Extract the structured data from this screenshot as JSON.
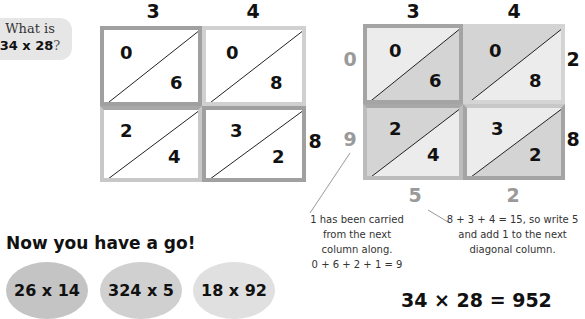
{
  "question": {
    "line1": "What is",
    "expression": "34 x 28",
    "mark": "?"
  },
  "left_grid": {
    "top_digits": [
      "3",
      "4"
    ],
    "right_digits": [
      "2",
      "8"
    ],
    "cells": [
      {
        "tens": "0",
        "units": "6"
      },
      {
        "tens": "0",
        "units": "8"
      },
      {
        "tens": "2",
        "units": "4"
      },
      {
        "tens": "3",
        "units": "2"
      }
    ]
  },
  "right_grid": {
    "top_digits": [
      "3",
      "4"
    ],
    "right_digits": [
      "2",
      "8"
    ],
    "left_results": [
      "0",
      "9"
    ],
    "bottom_results": [
      "5",
      "2"
    ],
    "cells": [
      {
        "tens": "0",
        "units": "6"
      },
      {
        "tens": "0",
        "units": "8"
      },
      {
        "tens": "2",
        "units": "4"
      },
      {
        "tens": "3",
        "units": "2"
      }
    ]
  },
  "notes": {
    "carry": [
      "1 has been carried",
      "from the next",
      "column along.",
      "0 + 6 + 2 + 1 = 9"
    ],
    "sum": [
      "8 + 3 + 4 = 15, so  write 5",
      "and add 1 to the next",
      "diagonal column."
    ]
  },
  "practice": {
    "title": "Now you have a go!",
    "problems": [
      "26 x 14",
      "324 x 5",
      "18 x 92"
    ]
  },
  "answer": "34 × 28 = 952",
  "colors": {
    "border_dark": "#9c9c9c",
    "border_light": "#c8c8c8",
    "shade": "#d4d4d4",
    "shade_light": "#ececec",
    "grey_digit": "#9a9a9a",
    "bubble": "#e6e6e6",
    "oval1": "#c4c4c4",
    "oval2": "#d0d0d0",
    "oval3": "#e0e0e0"
  }
}
